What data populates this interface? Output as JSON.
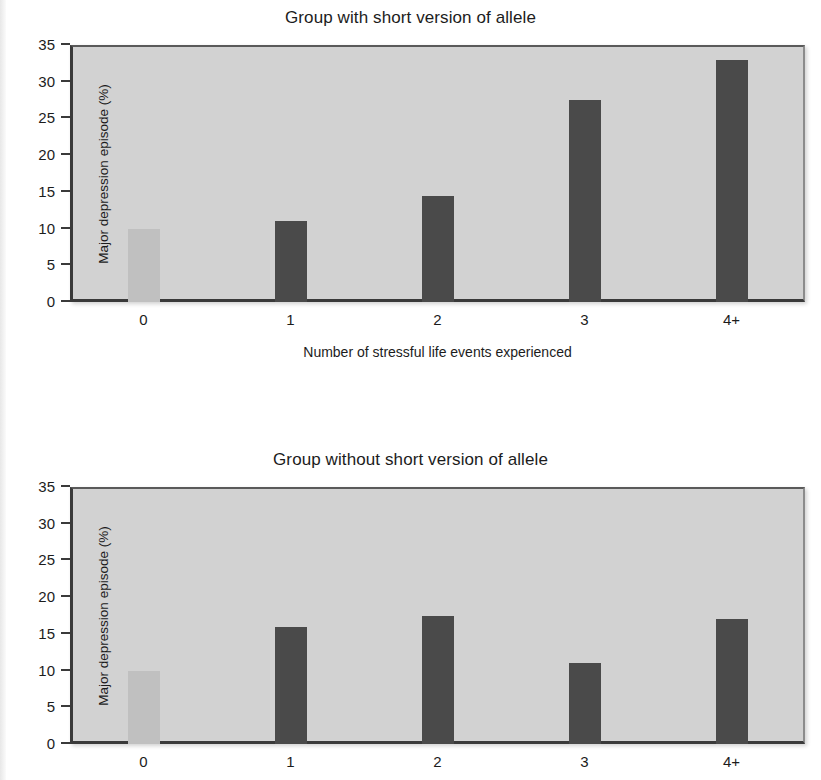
{
  "figure": {
    "panels": [
      {
        "name": "group-with-short-allele",
        "title": "Group with short version of allele"
      },
      {
        "name": "group-without-short-allele",
        "title": "Group without short version of allele"
      }
    ],
    "shared": {
      "ylabel": "Major depression episode (%)",
      "xlabel": "Number of stressful life events experienced",
      "yticks": [
        "0",
        "5",
        "10",
        "15",
        "20",
        "25",
        "30",
        "35"
      ],
      "xticks": [
        "0",
        "1",
        "2",
        "3",
        "4+"
      ]
    },
    "colors": {
      "bar_dark": "#4a4a4a",
      "bar_light": "#c0c0c0",
      "plot_background": "#d2d2d2",
      "axis": "#3a3a3a",
      "text": "#1c1c1c"
    }
  },
  "chart_data": [
    {
      "type": "bar",
      "title": "Group with short version of allele",
      "xlabel": "Number of stressful life events experienced",
      "ylabel": "Major depression episode (%)",
      "categories": [
        "0",
        "1",
        "2",
        "3",
        "4+"
      ],
      "values": [
        10,
        11,
        14.5,
        27.5,
        33
      ],
      "bar_colors": [
        "#c0c0c0",
        "#4a4a4a",
        "#4a4a4a",
        "#4a4a4a",
        "#4a4a4a"
      ],
      "ylim": [
        0,
        35
      ],
      "ytick_step": 5,
      "grid": false,
      "legend": "none"
    },
    {
      "type": "bar",
      "title": "Group without short version of allele",
      "xlabel": "Number of stressful life events experienced",
      "ylabel": "Major depression episode (%)",
      "categories": [
        "0",
        "1",
        "2",
        "3",
        "4+"
      ],
      "values": [
        10,
        16,
        17.5,
        11,
        17
      ],
      "bar_colors": [
        "#c0c0c0",
        "#4a4a4a",
        "#4a4a4a",
        "#4a4a4a",
        "#4a4a4a"
      ],
      "ylim": [
        0,
        35
      ],
      "ytick_step": 5,
      "grid": false,
      "legend": "none"
    }
  ]
}
